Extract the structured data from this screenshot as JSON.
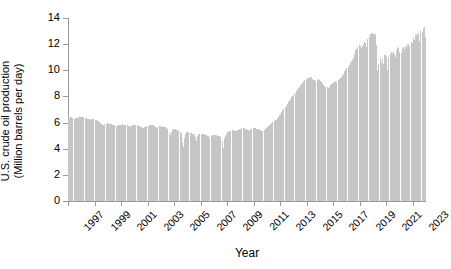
{
  "chart_data": {
    "type": "bar",
    "title": "",
    "xlabel": "Year",
    "ylabel_line1": "U.S. crude oil production",
    "ylabel_line2": "(Million barrels per day)",
    "ylim": [
      0,
      14
    ],
    "yticks": [
      0,
      2,
      4,
      6,
      8,
      10,
      12,
      14
    ],
    "ytick_labels": [
      "0",
      "2",
      "4",
      "6",
      "8",
      "10",
      "12",
      "14"
    ],
    "xlim": [
      1997.0,
      2024.0
    ],
    "xticks": [
      1997,
      1999,
      2001,
      2003,
      2005,
      2007,
      2009,
      2011,
      2013,
      2015,
      2017,
      2019,
      2021,
      2023
    ],
    "xtick_labels": [
      "1997",
      "1999",
      "2001",
      "2003",
      "2005",
      "2007",
      "2009",
      "2011",
      "2013",
      "2015",
      "2017",
      "2019",
      "2021",
      "2023"
    ],
    "grid": false,
    "legend": null,
    "bar_color": "#c6c6c6",
    "axis_color": "#9a9a9a",
    "frequency": "monthly",
    "x_start": 1997.0,
    "x_step": 0.08333,
    "series_name": "U.S. crude oil production",
    "values": [
      6.42,
      6.38,
      6.45,
      6.4,
      6.36,
      6.3,
      6.33,
      6.36,
      6.32,
      6.4,
      6.45,
      6.44,
      6.45,
      6.4,
      6.43,
      6.38,
      6.35,
      6.3,
      6.28,
      6.25,
      6.22,
      6.3,
      6.28,
      6.25,
      6.22,
      6.18,
      6.15,
      6.1,
      6.05,
      5.95,
      5.9,
      5.85,
      5.8,
      5.88,
      5.92,
      5.95,
      5.95,
      5.92,
      5.9,
      5.88,
      5.85,
      5.82,
      5.78,
      5.75,
      5.72,
      5.78,
      5.8,
      5.82,
      5.85,
      5.88,
      5.85,
      5.82,
      5.8,
      5.78,
      5.75,
      5.72,
      5.68,
      5.75,
      5.78,
      5.8,
      5.82,
      5.8,
      5.78,
      5.75,
      5.72,
      5.68,
      5.65,
      5.62,
      5.58,
      5.65,
      5.7,
      5.72,
      5.75,
      5.78,
      5.82,
      5.85,
      5.82,
      5.78,
      5.72,
      5.68,
      5.6,
      5.68,
      5.72,
      5.75,
      5.7,
      5.72,
      5.7,
      5.68,
      5.65,
      5.58,
      5.5,
      5.2,
      5.05,
      5.3,
      5.45,
      5.52,
      5.5,
      5.48,
      5.45,
      5.42,
      5.38,
      5.3,
      5.2,
      4.55,
      4.1,
      4.85,
      5.15,
      5.25,
      5.28,
      5.25,
      5.22,
      5.18,
      5.15,
      5.1,
      5.05,
      4.92,
      4.6,
      5.0,
      5.1,
      5.15,
      5.12,
      5.1,
      5.15,
      5.12,
      5.08,
      5.05,
      5.0,
      4.95,
      4.85,
      4.98,
      5.02,
      5.05,
      5.08,
      5.05,
      5.02,
      5.0,
      4.98,
      4.95,
      4.9,
      4.62,
      4.05,
      4.8,
      5.0,
      5.1,
      5.25,
      5.3,
      5.35,
      5.38,
      5.4,
      5.42,
      5.38,
      5.35,
      5.32,
      5.42,
      5.45,
      5.48,
      5.52,
      5.55,
      5.58,
      5.55,
      5.52,
      5.48,
      5.45,
      5.42,
      5.38,
      5.48,
      5.52,
      5.55,
      5.58,
      5.55,
      5.52,
      5.5,
      5.48,
      5.45,
      5.42,
      5.38,
      5.35,
      5.45,
      5.52,
      5.58,
      5.65,
      5.72,
      5.8,
      5.88,
      5.95,
      6.02,
      6.1,
      6.18,
      6.22,
      6.32,
      6.45,
      6.55,
      6.68,
      6.82,
      6.95,
      7.05,
      7.18,
      7.28,
      7.42,
      7.55,
      7.65,
      7.82,
      7.95,
      8.05,
      8.15,
      8.25,
      8.42,
      8.55,
      8.68,
      8.75,
      8.85,
      8.95,
      9.05,
      9.18,
      9.28,
      9.35,
      9.4,
      9.42,
      9.38,
      9.45,
      9.48,
      9.35,
      9.28,
      9.22,
      9.15,
      9.25,
      9.3,
      9.22,
      9.15,
      9.08,
      9.0,
      8.88,
      8.82,
      8.75,
      8.7,
      8.68,
      8.72,
      8.85,
      8.92,
      9.0,
      9.05,
      9.12,
      9.18,
      9.12,
      9.22,
      9.32,
      9.42,
      9.52,
      9.62,
      9.72,
      9.92,
      10.05,
      10.15,
      10.25,
      10.42,
      10.55,
      10.68,
      10.82,
      10.95,
      11.25,
      11.55,
      11.62,
      11.82,
      11.95,
      11.85,
      11.72,
      11.88,
      12.05,
      12.15,
      12.08,
      11.82,
      12.42,
      12.52,
      12.75,
      12.82,
      12.78,
      12.85,
      12.72,
      12.78,
      11.95,
      10.05,
      10.45,
      10.95,
      10.58,
      10.85,
      10.45,
      11.15,
      11.18,
      11.12,
      10.05,
      11.05,
      11.28,
      11.38,
      11.32,
      11.42,
      11.25,
      11.02,
      11.55,
      11.75,
      11.68,
      11.38,
      11.32,
      11.72,
      11.82,
      11.62,
      11.85,
      11.82,
      11.98,
      11.98,
      11.88,
      12.15,
      12.12,
      12.48,
      12.32,
      12.68,
      12.72,
      12.82,
      12.78,
      12.22,
      12.98,
      12.92,
      13.25,
      13.28,
      12.55
    ]
  }
}
